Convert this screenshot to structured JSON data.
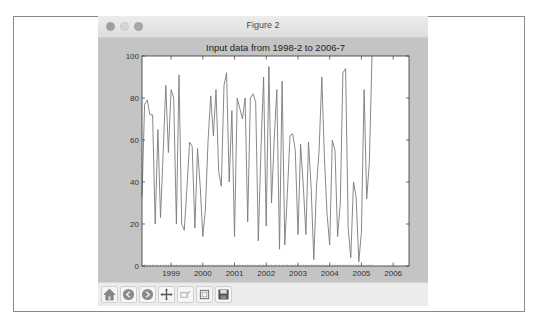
{
  "window": {
    "title": "Figure 2"
  },
  "toolbar": {
    "buttons": [
      {
        "name": "home",
        "icon": "home-icon"
      },
      {
        "name": "back",
        "icon": "back-arrow-icon"
      },
      {
        "name": "forward",
        "icon": "forward-arrow-icon"
      },
      {
        "name": "pan",
        "icon": "move-cross-icon"
      },
      {
        "name": "zoom",
        "icon": "zoom-rect-icon"
      },
      {
        "name": "subplots",
        "icon": "configure-subplots-icon"
      },
      {
        "name": "save",
        "icon": "save-floppy-icon"
      }
    ]
  },
  "colors": {
    "figure_bg": "#c4c4c4",
    "axes_bg": "#ffffff",
    "line": "#7a7a7a",
    "axes_edge": "#333333"
  },
  "chart_data": {
    "type": "line",
    "title": "Input data from 1998-2 to 2006-7",
    "xlabel": "",
    "ylabel": "",
    "ylim": [
      0,
      100
    ],
    "yticks": [
      0,
      20,
      40,
      60,
      80,
      100
    ],
    "xticks": [
      "1999",
      "2000",
      "2001",
      "2002",
      "2003",
      "2004",
      "2005",
      "2006"
    ],
    "xlim": [
      "1998-2",
      "2006-7"
    ],
    "grid": false,
    "legend": null,
    "series": [
      {
        "name": "input",
        "start": "1998-2",
        "frequency": "monthly",
        "values": [
          33,
          77,
          79,
          72,
          72,
          20,
          65,
          23,
          53,
          86,
          54,
          84,
          80,
          20,
          91,
          20,
          17,
          37,
          59,
          57,
          18,
          56,
          38,
          14,
          27,
          60,
          81,
          62,
          84,
          45,
          38,
          86,
          92,
          40,
          74,
          14,
          80,
          75,
          70,
          80,
          21,
          80,
          82,
          78,
          12,
          56,
          90,
          19,
          95,
          30,
          60,
          84,
          8,
          88,
          10,
          35,
          62,
          63,
          55,
          15,
          58,
          38,
          15,
          59,
          37,
          3,
          38,
          55,
          90,
          52,
          25,
          10,
          60,
          55,
          14,
          30,
          92,
          94,
          18,
          4,
          40,
          33,
          2,
          16,
          84,
          32,
          49,
          100
        ]
      }
    ]
  }
}
